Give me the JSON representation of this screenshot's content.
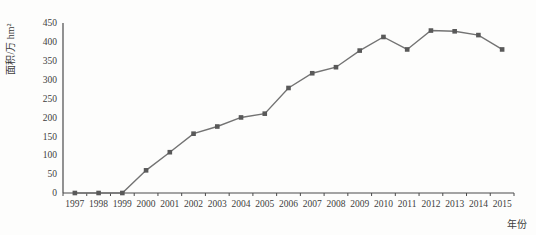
{
  "chart_data": {
    "type": "line",
    "title": "",
    "xlabel": "年份",
    "ylabel": "面积/万 hm²",
    "categories": [
      "1997",
      "1998",
      "1999",
      "2000",
      "2001",
      "2002",
      "2003",
      "2004",
      "2005",
      "2006",
      "2007",
      "2008",
      "2009",
      "2010",
      "2011",
      "2012",
      "2013",
      "2014",
      "2015"
    ],
    "series": [
      {
        "name": "面积",
        "values": [
          0,
          0,
          0,
          60,
          108,
          157,
          176,
          200,
          210,
          278,
          317,
          333,
          377,
          413,
          380,
          430,
          428,
          418,
          380
        ]
      }
    ],
    "ylim": [
      0,
      450
    ],
    "ytick_step": 50,
    "yticks": [
      0,
      50,
      100,
      150,
      200,
      250,
      300,
      350,
      400,
      450
    ],
    "grid": false,
    "legend_position": "none",
    "marker": "square",
    "colors": {
      "background": "#fdfdfc",
      "axis": "#4a4a4a",
      "line": "#737373",
      "marker": "#595959",
      "text": "#3d3d3d"
    }
  }
}
